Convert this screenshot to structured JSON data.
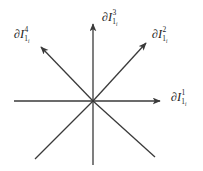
{
  "figure": {
    "name": "eight-ray-star-axis-diagram",
    "background_color": "#ffffff",
    "line_color": "#3a3a3a",
    "text_color": "#1b1b1b",
    "origin": {
      "x": 93,
      "y": 101
    }
  },
  "labels": {
    "axis1": {
      "partial": "∂",
      "base": "I",
      "sup": "1",
      "sub": "1",
      "subsub": "i",
      "full": "∂I¹₁ᵢ"
    },
    "axis2": {
      "partial": "∂",
      "base": "I",
      "sup": "2",
      "sub": "1",
      "subsub": "i",
      "full": "∂I²₁ᵢ"
    },
    "axis3": {
      "partial": "∂",
      "base": "I",
      "sup": "3",
      "sub": "1",
      "subsub": "i",
      "full": "∂I³₁ᵢ"
    },
    "axis4": {
      "partial": "∂",
      "base": "I",
      "sup": "4",
      "sub": "1",
      "subsub": "i",
      "full": "∂I⁴₁ᵢ"
    }
  },
  "rays": [
    {
      "name": "ray-east",
      "direction": "east",
      "arrow": true,
      "x1": 93,
      "y1": 101,
      "x2": 166,
      "y2": 101,
      "label": "axis1"
    },
    {
      "name": "ray-northeast",
      "direction": "northeast",
      "arrow": true,
      "x1": 93,
      "y1": 101,
      "x2": 150,
      "y2": 39,
      "label": "axis2"
    },
    {
      "name": "ray-north",
      "direction": "north",
      "arrow": true,
      "x1": 93,
      "y1": 101,
      "x2": 93,
      "y2": 19,
      "label": "axis3"
    },
    {
      "name": "ray-northwest",
      "direction": "northwest",
      "arrow": true,
      "x1": 93,
      "y1": 101,
      "x2": 37,
      "y2": 43,
      "label": "axis4"
    },
    {
      "name": "ray-west",
      "direction": "west",
      "arrow": false,
      "x1": 93,
      "y1": 101,
      "x2": 14,
      "y2": 101,
      "label": null
    },
    {
      "name": "ray-southwest",
      "direction": "southwest",
      "arrow": false,
      "x1": 93,
      "y1": 101,
      "x2": 35,
      "y2": 159,
      "label": null
    },
    {
      "name": "ray-south",
      "direction": "south",
      "arrow": false,
      "x1": 93,
      "y1": 101,
      "x2": 93,
      "y2": 165,
      "label": null
    },
    {
      "name": "ray-southeast",
      "direction": "southeast",
      "arrow": false,
      "x1": 93,
      "y1": 101,
      "x2": 155,
      "y2": 157,
      "label": null
    }
  ]
}
